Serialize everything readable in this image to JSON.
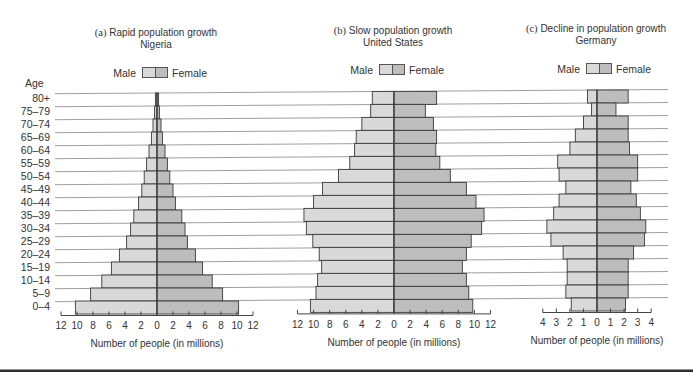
{
  "figure": {
    "colors": {
      "male": "#d9d9d9",
      "female": "#bdbdbd",
      "outline": "#3a3a3a",
      "grid": "#a0a0a0",
      "axis": "#444444",
      "rule": "#2e2e2e",
      "text": "#333333"
    }
  },
  "chart_data": [
    {
      "type": "bar",
      "orientation": "horizontal",
      "variant": "population-pyramid",
      "label": "(a)",
      "title": "Rapid population growth",
      "subtitle": "Nigeria",
      "xlabel": "Number of people (in millions)",
      "ylabel": "Age",
      "categories": [
        "80+",
        "75–79",
        "70–74",
        "65–69",
        "60–64",
        "55–59",
        "50–54",
        "45–49",
        "40–44",
        "35–39",
        "30–34",
        "25–29",
        "20–24",
        "15–19",
        "10–14",
        "5–9",
        "0–4"
      ],
      "series": [
        {
          "name": "Male",
          "values": [
            0.2,
            0.3,
            0.5,
            0.7,
            1.0,
            1.3,
            1.6,
            1.9,
            2.3,
            2.9,
            3.3,
            3.8,
            4.7,
            5.7,
            6.9,
            8.3,
            10.2
          ]
        },
        {
          "name": "Female",
          "values": [
            0.2,
            0.3,
            0.5,
            0.7,
            1.0,
            1.3,
            1.6,
            2.0,
            2.3,
            3.1,
            3.5,
            3.8,
            4.8,
            5.7,
            6.9,
            8.2,
            10.2
          ]
        }
      ],
      "xlim": [
        -12,
        12
      ],
      "tick_step": 2,
      "tick_labels": [
        "12",
        "10",
        "8",
        "6",
        "4",
        "2",
        "0",
        "2",
        "4",
        "6",
        "8",
        "10",
        "12"
      ],
      "grid": true,
      "legend_position": "top"
    },
    {
      "type": "bar",
      "orientation": "horizontal",
      "variant": "population-pyramid",
      "label": "(b)",
      "title": "Slow population growth",
      "subtitle": "United States",
      "xlabel": "Number of people (in millions)",
      "ylabel": "Age",
      "categories": [
        "80+",
        "75–79",
        "70–74",
        "65–69",
        "60–64",
        "55–59",
        "50–54",
        "45–49",
        "40–44",
        "35–39",
        "30–34",
        "25–29",
        "20–24",
        "15–19",
        "10–14",
        "5–9",
        "0–4"
      ],
      "series": [
        {
          "name": "Male",
          "values": [
            2.7,
            2.9,
            4.0,
            4.7,
            4.9,
            5.5,
            6.9,
            8.9,
            10.0,
            11.2,
            10.9,
            10.1,
            9.3,
            9.0,
            9.5,
            9.7,
            10.4
          ]
        },
        {
          "name": "Female",
          "values": [
            5.3,
            3.9,
            4.9,
            5.3,
            5.2,
            5.7,
            7.0,
            9.0,
            10.2,
            11.2,
            10.9,
            9.6,
            9.0,
            8.5,
            9.0,
            9.3,
            9.8
          ]
        }
      ],
      "xlim": [
        -12,
        12
      ],
      "tick_step": 2,
      "tick_labels": [
        "12",
        "10",
        "8",
        "6",
        "4",
        "2",
        "0",
        "2",
        "4",
        "6",
        "8",
        "10",
        "12"
      ],
      "grid": true,
      "legend_position": "top"
    },
    {
      "type": "bar",
      "orientation": "horizontal",
      "variant": "population-pyramid",
      "label": "(c)",
      "title": "Decline in population growth",
      "subtitle": "Germany",
      "xlabel": "Number of people (in millions)",
      "ylabel": "Age",
      "categories": [
        "80+",
        "75–79",
        "70–74",
        "65–69",
        "60–64",
        "55–59",
        "50–54",
        "45–49",
        "40–44",
        "35–39",
        "30–34",
        "25–29",
        "20–24",
        "15–19",
        "10–14",
        "5–9",
        "0–4"
      ],
      "series": [
        {
          "name": "Male",
          "values": [
            0.7,
            0.4,
            1.0,
            1.6,
            2.0,
            2.9,
            2.8,
            2.3,
            2.8,
            3.2,
            3.7,
            3.4,
            2.5,
            2.2,
            2.2,
            2.3,
            1.9
          ]
        },
        {
          "name": "Female",
          "values": [
            2.3,
            1.4,
            2.3,
            2.3,
            2.4,
            3.0,
            3.0,
            2.5,
            2.9,
            3.2,
            3.6,
            3.5,
            2.7,
            2.3,
            2.3,
            2.3,
            2.1
          ]
        }
      ],
      "xlim": [
        -4,
        4
      ],
      "tick_step": 1,
      "tick_labels": [
        "4",
        "3",
        "2",
        "1",
        "0",
        "1",
        "2",
        "3",
        "4"
      ],
      "grid": true,
      "legend_position": "top"
    }
  ]
}
